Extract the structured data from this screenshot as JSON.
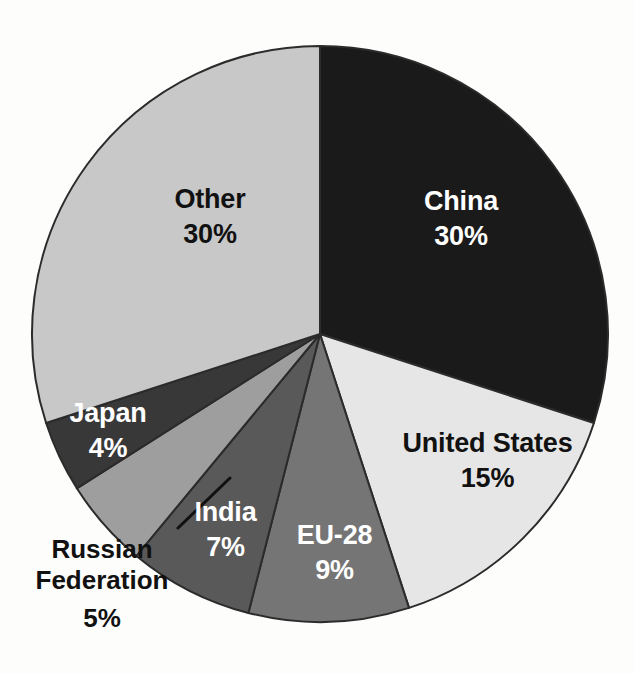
{
  "chart_data": {
    "type": "pie",
    "title": "",
    "subtitle": "",
    "xlabel": "",
    "ylabel": "",
    "legend_position": "none",
    "grid": false,
    "labels_inside": true,
    "start_angle_deg": 0,
    "direction": "clockwise",
    "categories": [
      "China",
      "United States",
      "EU-28",
      "India",
      "Russian Federation",
      "Japan",
      "Other"
    ],
    "values": [
      30,
      15,
      9,
      7,
      5,
      4,
      30
    ],
    "value_suffix": "%",
    "slices": [
      {
        "name": "China",
        "value": 30,
        "value_label": "30%",
        "color": "#1a1a1a",
        "text_color": "#ffffff",
        "label_placement": "inside"
      },
      {
        "name": "United States",
        "value": 15,
        "value_label": "15%",
        "color": "#e6e6e6",
        "text_color": "#111111",
        "label_placement": "inside"
      },
      {
        "name": "EU-28",
        "value": 9,
        "value_label": "9%",
        "color": "#757575",
        "text_color": "#ffffff",
        "label_placement": "inside"
      },
      {
        "name": "India",
        "value": 7,
        "value_label": "7%",
        "color": "#595959",
        "text_color": "#ffffff",
        "label_placement": "inside"
      },
      {
        "name": "Russian Federation",
        "value": 5,
        "value_label": "5%",
        "color": "#9e9e9e",
        "text_color": "#111111",
        "label_placement": "outside-leader"
      },
      {
        "name": "Japan",
        "value": 4,
        "value_label": "4%",
        "color": "#383838",
        "text_color": "#ffffff",
        "label_placement": "inside"
      },
      {
        "name": "Other",
        "value": 30,
        "value_label": "30%",
        "color": "#c8c8c8",
        "text_color": "#111111",
        "label_placement": "inside"
      }
    ],
    "geometry": {
      "center_x": 320,
      "center_y": 334,
      "radius": 288,
      "stroke_color": "#2b2b2b"
    }
  }
}
